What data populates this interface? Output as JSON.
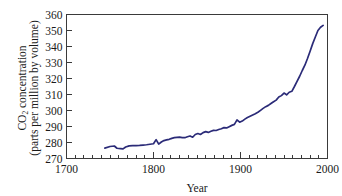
{
  "chart_data": {
    "type": "line",
    "title": "",
    "xlabel": "Year",
    "ylabel_line1": "CO",
    "ylabel_sub": "2",
    "ylabel_line1_rest": " concentration",
    "ylabel_line2": "(parts per million by volume)",
    "xlim": [
      1700,
      2000
    ],
    "ylim": [
      270,
      360
    ],
    "xticks": [
      1700,
      1800,
      1900,
      2000
    ],
    "xticklabels": [
      "1700",
      "1800",
      "1900",
      "2000"
    ],
    "xminor_step": 10,
    "yticks": [
      270,
      280,
      290,
      300,
      310,
      320,
      330,
      340,
      350,
      360
    ],
    "yticklabels": [
      "270",
      "280",
      "290",
      "300",
      "310",
      "320",
      "330",
      "340",
      "350",
      "360"
    ],
    "grid": false,
    "legend": "none",
    "line_color": "#2b2b78",
    "series": [
      {
        "name": "CO2 concentration",
        "x": [
          1744,
          1750,
          1755,
          1758,
          1762,
          1765,
          1768,
          1772,
          1776,
          1780,
          1784,
          1788,
          1792,
          1796,
          1800,
          1803,
          1806,
          1809,
          1812,
          1815,
          1818,
          1821,
          1824,
          1827,
          1830,
          1833,
          1836,
          1839,
          1842,
          1845,
          1848,
          1851,
          1854,
          1857,
          1860,
          1863,
          1866,
          1869,
          1872,
          1875,
          1878,
          1881,
          1884,
          1887,
          1890,
          1893,
          1896,
          1899,
          1902,
          1905,
          1908,
          1911,
          1914,
          1917,
          1920,
          1923,
          1926,
          1929,
          1932,
          1935,
          1938,
          1941,
          1944,
          1947,
          1950,
          1953,
          1956,
          1959,
          1962,
          1965,
          1968,
          1971,
          1974,
          1977,
          1980,
          1983,
          1986,
          1989,
          1992,
          1995
        ],
        "y": [
          276.5,
          277.5,
          277.8,
          276.4,
          276.2,
          276.0,
          277.2,
          277.9,
          278.0,
          278.1,
          278.2,
          278.4,
          278.6,
          278.9,
          279.2,
          281.8,
          279.0,
          280.3,
          281.2,
          281.6,
          282.0,
          282.6,
          283.0,
          283.2,
          283.4,
          283.1,
          283.0,
          283.6,
          284.1,
          283.3,
          285.0,
          285.6,
          285.0,
          286.2,
          286.8,
          286.3,
          287.0,
          287.6,
          287.5,
          288.1,
          288.6,
          289.3,
          289.1,
          289.9,
          290.7,
          291.3,
          294.1,
          292.7,
          293.4,
          294.6,
          295.6,
          296.4,
          297.2,
          298.0,
          298.9,
          300.1,
          301.3,
          302.4,
          303.2,
          304.4,
          305.5,
          306.5,
          308.4,
          309.3,
          310.9,
          309.8,
          311.4,
          312.0,
          315.0,
          318.2,
          321.4,
          325.0,
          328.3,
          332.5,
          337.0,
          341.8,
          345.9,
          350.0,
          352.0,
          353.2
        ]
      }
    ]
  },
  "axis": {
    "xlabel": "Year",
    "ylabel_full": "CO2 concentration (parts per million by volume)"
  }
}
